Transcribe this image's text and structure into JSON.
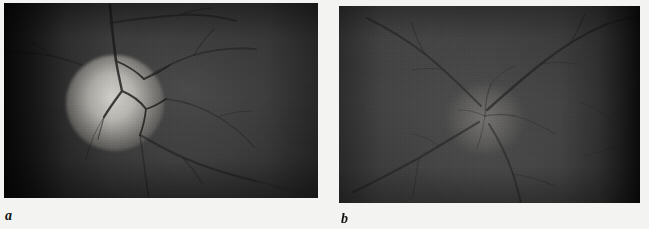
{
  "figure": {
    "type": "two-panel grayscale fundus photograph figure",
    "background_color": "#f3f3f1",
    "panels": [
      {
        "id": "a",
        "label": "a",
        "modality": "color fundus photograph (grayscale reproduction)",
        "subject": "optic nerve head / optic disc",
        "description": "Bright, sharply demarcated optic disc left of centre with dark retinal vessels emerging and arcading to the right; dark vignetted left margin.",
        "disc_appearance": "bright pale well-defined disc",
        "base_color": "#3b3b3b",
        "disc_color": "#d6d4ce",
        "vessel_color": "#1d1d1d",
        "vignette_side": "left"
      },
      {
        "id": "b",
        "label": "b",
        "modality": "color fundus photograph (grayscale reproduction)",
        "subject": "optic nerve head / optic disc",
        "description": "Faint, indistinct optic disc near centre with radiating retinal vessels; a prominent vessel crosses the upper right; dark vignetted right margin.",
        "disc_appearance": "faint blurred disc margin",
        "base_color": "#434343",
        "disc_color": "#96948f",
        "vessel_color": "#222222",
        "vignette_side": "right"
      }
    ]
  }
}
